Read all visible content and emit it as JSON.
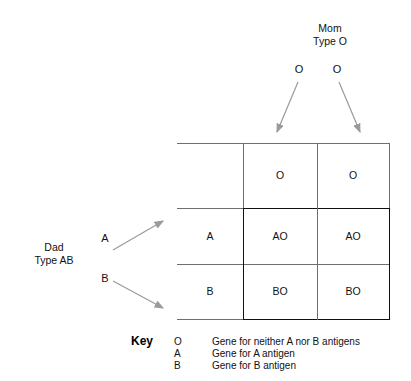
{
  "diagram": {
    "title_mom": "Mom\nType O",
    "title_dad": "Dad\nType AB",
    "mom": {
      "name": "Mom",
      "type": "Type O",
      "alleles": [
        "O",
        "O"
      ]
    },
    "dad": {
      "name": "Dad",
      "type": "Type AB",
      "alleles": [
        "A",
        "B"
      ]
    },
    "grid": {
      "column_headers": [
        "O",
        "O"
      ],
      "row_headers": [
        "A",
        "B"
      ],
      "offspring": [
        [
          "AO",
          "AO"
        ],
        [
          "BO",
          "BO"
        ]
      ]
    },
    "key": {
      "title": "Key",
      "entries": [
        {
          "symbol": "O",
          "description": "Gene for neither A nor B antigens"
        },
        {
          "symbol": "A",
          "description": "Gene for A antigen"
        },
        {
          "symbol": "B",
          "description": "Gene for B antigen"
        }
      ]
    },
    "colors": {
      "arrow": "#9a9a9a",
      "grid_line": "#6f6f6f",
      "inner_box_line": "#101010",
      "text": "#111111",
      "background": "#ffffff"
    }
  }
}
